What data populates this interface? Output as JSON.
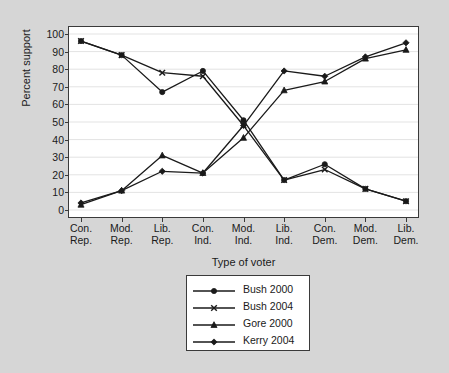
{
  "figure": {
    "background_color": "#d6d6d6",
    "plot_background_color": "#ffffff",
    "frame_color": "#3a3a3a",
    "series_color": "#1a1a1a",
    "gridline_color": "#e3e3e3"
  },
  "axes": {
    "y_title": "Percent support",
    "x_title": "Type of voter",
    "y_ticks": [
      "0",
      "10",
      "20",
      "30",
      "40",
      "50",
      "60",
      "70",
      "80",
      "90",
      "100"
    ],
    "x_tick_lines": [
      [
        "Con.",
        "Rep."
      ],
      [
        "Mod.",
        "Rep."
      ],
      [
        "Lib.",
        "Rep."
      ],
      [
        "Con.",
        "Ind."
      ],
      [
        "Mod.",
        "Ind."
      ],
      [
        "Lib.",
        "Ind."
      ],
      [
        "Con.",
        "Dem."
      ],
      [
        "Mod.",
        "Dem."
      ],
      [
        "Lib.",
        "Dem."
      ]
    ]
  },
  "legend": {
    "items": [
      {
        "label": "Bush 2000",
        "marker": "circle-marker"
      },
      {
        "label": "Bush 2004",
        "marker": "x-marker"
      },
      {
        "label": "Gore 2000",
        "marker": "triangle-marker"
      },
      {
        "label": "Kerry 2004",
        "marker": "diamond-marker"
      }
    ]
  },
  "chart_data": {
    "type": "line",
    "title": "",
    "xlabel": "Type of voter",
    "ylabel": "Percent support",
    "ylim": [
      0,
      100
    ],
    "ytick_step": 10,
    "grid": true,
    "legend_position": "below-axes-center",
    "categories": [
      "Con. Rep.",
      "Mod. Rep.",
      "Lib. Rep.",
      "Con. Ind.",
      "Mod. Ind.",
      "Lib. Ind.",
      "Con. Dem.",
      "Mod. Dem.",
      "Lib. Dem."
    ],
    "series": [
      {
        "name": "Bush 2000",
        "marker": "circle",
        "values": [
          96,
          88,
          67,
          79,
          51,
          17,
          26,
          12,
          5
        ]
      },
      {
        "name": "Bush 2004",
        "marker": "x",
        "values": [
          96,
          88,
          78,
          76,
          48,
          17,
          23,
          12,
          5
        ]
      },
      {
        "name": "Gore 2000",
        "marker": "triangle",
        "values": [
          3,
          11,
          31,
          21,
          41,
          68,
          73,
          86,
          91
        ]
      },
      {
        "name": "Kerry 2004",
        "marker": "diamond",
        "values": [
          4,
          11,
          22,
          21,
          48,
          79,
          76,
          87,
          95
        ]
      }
    ]
  }
}
